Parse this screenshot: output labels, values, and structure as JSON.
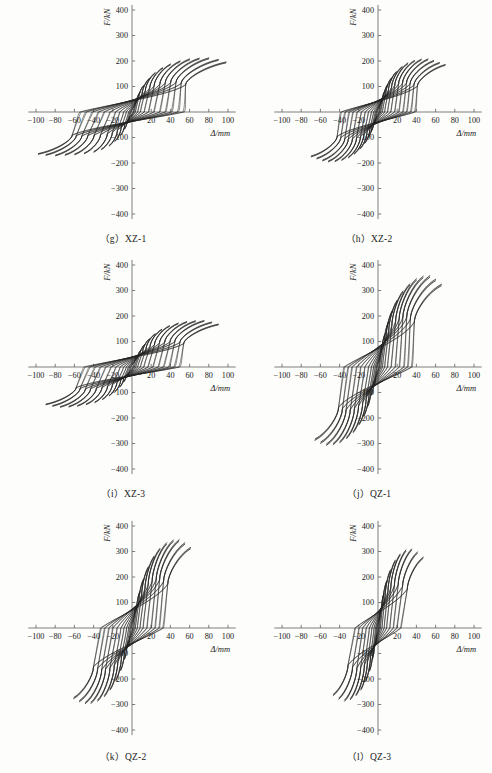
{
  "figure": {
    "kind": "hysteresis-loop-panel-grid",
    "panel_count": 6,
    "shared_axes": {
      "xlabel": "Δ/mm",
      "ylabel": "F/kN",
      "xlim": [
        -110,
        110
      ],
      "ylim": [
        -430,
        430
      ],
      "xticks": [
        -100,
        -80,
        -60,
        -40,
        -20,
        20,
        40,
        60,
        80,
        100
      ],
      "xtick_labels": [
        "−100",
        "−80",
        "−60",
        "−40",
        "−20",
        "20",
        "40",
        "60",
        "80",
        "100"
      ],
      "yticks": [
        400,
        300,
        200,
        100,
        -100,
        -200,
        -300,
        -400
      ],
      "ytick_labels": [
        "400",
        "300",
        "200",
        "100",
        "−100",
        "−200",
        "−300",
        "−400"
      ],
      "grid": false,
      "legend": "none"
    }
  },
  "panels": [
    {
      "id": "xz-1",
      "caption": "（g）XZ-1",
      "letter": "g",
      "specimen": "XZ-1",
      "peak_force_pos": 212,
      "peak_force_neg": -172,
      "peak_disp_pos": 98,
      "peak_disp_neg": -88,
      "n_cycles": 13
    },
    {
      "id": "xz-2",
      "caption": "（h）XZ-2",
      "letter": "h",
      "specimen": "XZ-2",
      "peak_force_pos": 208,
      "peak_force_neg": -196,
      "peak_disp_pos": 70,
      "peak_disp_neg": -62,
      "n_cycles": 13
    },
    {
      "id": "xz-3",
      "caption": "（i）XZ-3",
      "letter": "i",
      "specimen": "XZ-3",
      "peak_force_pos": 182,
      "peak_force_neg": -158,
      "peak_disp_pos": 88,
      "peak_disp_neg": -92,
      "n_cycles": 13
    },
    {
      "id": "qz-1",
      "caption": "（j）QZ-1",
      "letter": "j",
      "specimen": "QZ-1",
      "peak_force_pos": 358,
      "peak_force_neg": -308,
      "peak_disp_pos": 66,
      "peak_disp_neg": -74,
      "n_cycles": 12
    },
    {
      "id": "qz-2",
      "caption": "（k）QZ-2",
      "letter": "k",
      "specimen": "QZ-2",
      "peak_force_pos": 346,
      "peak_force_neg": -298,
      "peak_disp_pos": 62,
      "peak_disp_neg": -60,
      "n_cycles": 11
    },
    {
      "id": "qz-3",
      "caption": "（l）QZ-3",
      "letter": "l",
      "specimen": "QZ-3",
      "peak_force_pos": 310,
      "peak_force_neg": -288,
      "peak_disp_pos": 50,
      "peak_disp_neg": -44,
      "n_cycles": 10
    }
  ],
  "chart_data": [
    {
      "type": "line",
      "title": "（g）XZ-1",
      "xlabel": "Δ/mm",
      "ylabel": "F/kN",
      "xlim": [
        -110,
        110
      ],
      "ylim": [
        -430,
        430
      ],
      "xticks": [
        -100,
        -80,
        -60,
        -40,
        -20,
        20,
        40,
        60,
        80,
        100
      ],
      "yticks": [
        400,
        300,
        200,
        100,
        -100,
        -200,
        -300,
        -400
      ],
      "grid": false,
      "legend": "none",
      "series_kind": "cyclic-hysteresis-loops",
      "cycles": [
        {
          "disp_amp": 5,
          "force_pos": 52,
          "force_neg": -46,
          "slope_k": 11.5,
          "pinch": 0.3
        },
        {
          "disp_amp": 8,
          "force_pos": 76,
          "force_neg": -68,
          "slope_k": 10.6,
          "pinch": 0.33
        },
        {
          "disp_amp": 12,
          "force_pos": 104,
          "force_neg": -92,
          "slope_k": 9.4,
          "pinch": 0.36
        },
        {
          "disp_amp": 18,
          "force_pos": 132,
          "force_neg": -116,
          "slope_k": 8.0,
          "pinch": 0.4
        },
        {
          "disp_amp": 24,
          "force_pos": 154,
          "force_neg": -134,
          "slope_k": 6.9,
          "pinch": 0.44
        },
        {
          "disp_amp": 32,
          "force_pos": 174,
          "force_neg": -148,
          "slope_k": 5.8,
          "pinch": 0.48
        },
        {
          "disp_amp": 40,
          "force_pos": 188,
          "force_neg": -158,
          "slope_k": 5.0,
          "pinch": 0.52
        },
        {
          "disp_amp": 50,
          "force_pos": 200,
          "force_neg": -164,
          "slope_k": 4.3,
          "pinch": 0.55
        },
        {
          "disp_amp": 60,
          "force_pos": 208,
          "force_neg": -168,
          "slope_k": 3.7,
          "pinch": 0.58
        },
        {
          "disp_amp": 70,
          "force_pos": 211,
          "force_neg": -170,
          "slope_k": 3.2,
          "pinch": 0.6
        },
        {
          "disp_amp": 80,
          "force_pos": 212,
          "force_neg": -172,
          "slope_k": 2.8,
          "pinch": 0.62
        },
        {
          "disp_amp": 90,
          "force_pos": 206,
          "force_neg": -170,
          "slope_k": 2.4,
          "pinch": 0.64
        },
        {
          "disp_amp": 98,
          "force_pos": 196,
          "force_neg": -166,
          "slope_k": 2.1,
          "pinch": 0.66
        }
      ]
    },
    {
      "type": "line",
      "title": "（h）XZ-2",
      "xlabel": "Δ/mm",
      "ylabel": "F/kN",
      "xlim": [
        -110,
        110
      ],
      "ylim": [
        -430,
        430
      ],
      "xticks": [
        -100,
        -80,
        -60,
        -40,
        -20,
        20,
        40,
        60,
        80,
        100
      ],
      "yticks": [
        400,
        300,
        200,
        100,
        -100,
        -200,
        -300,
        -400
      ],
      "grid": false,
      "legend": "none",
      "series_kind": "cyclic-hysteresis-loops",
      "cycles": [
        {
          "disp_amp": 4,
          "force_pos": 54,
          "force_neg": -50,
          "slope_k": 14.5,
          "pinch": 0.3
        },
        {
          "disp_amp": 7,
          "force_pos": 82,
          "force_neg": -76,
          "slope_k": 13.2,
          "pinch": 0.33
        },
        {
          "disp_amp": 10,
          "force_pos": 108,
          "force_neg": -100,
          "slope_k": 11.8,
          "pinch": 0.36
        },
        {
          "disp_amp": 14,
          "force_pos": 134,
          "force_neg": -124,
          "slope_k": 10.2,
          "pinch": 0.4
        },
        {
          "disp_amp": 19,
          "force_pos": 158,
          "force_neg": -146,
          "slope_k": 8.8,
          "pinch": 0.44
        },
        {
          "disp_amp": 25,
          "force_pos": 178,
          "force_neg": -166,
          "slope_k": 7.4,
          "pinch": 0.48
        },
        {
          "disp_amp": 31,
          "force_pos": 192,
          "force_neg": -180,
          "slope_k": 6.4,
          "pinch": 0.52
        },
        {
          "disp_amp": 38,
          "force_pos": 202,
          "force_neg": -190,
          "slope_k": 5.5,
          "pinch": 0.55
        },
        {
          "disp_amp": 45,
          "force_pos": 207,
          "force_neg": -195,
          "slope_k": 4.8,
          "pinch": 0.58
        },
        {
          "disp_amp": 52,
          "force_pos": 208,
          "force_neg": -196,
          "slope_k": 4.2,
          "pinch": 0.6
        },
        {
          "disp_amp": 58,
          "force_pos": 202,
          "force_neg": -192,
          "slope_k": 3.7,
          "pinch": 0.62
        },
        {
          "disp_amp": 64,
          "force_pos": 194,
          "force_neg": -184,
          "slope_k": 3.3,
          "pinch": 0.64
        },
        {
          "disp_amp": 70,
          "force_pos": 186,
          "force_neg": -176,
          "slope_k": 2.9,
          "pinch": 0.66
        }
      ]
    },
    {
      "type": "line",
      "title": "（i）XZ-3",
      "xlabel": "Δ/mm",
      "ylabel": "F/kN",
      "xlim": [
        -110,
        110
      ],
      "ylim": [
        -430,
        430
      ],
      "xticks": [
        -100,
        -80,
        -60,
        -40,
        -20,
        20,
        40,
        60,
        80,
        100
      ],
      "yticks": [
        400,
        300,
        200,
        100,
        -100,
        -200,
        -300,
        -400
      ],
      "grid": false,
      "legend": "none",
      "series_kind": "cyclic-hysteresis-loops",
      "cycles": [
        {
          "disp_amp": 5,
          "force_pos": 44,
          "force_neg": -40,
          "slope_k": 9.8,
          "pinch": 0.3
        },
        {
          "disp_amp": 9,
          "force_pos": 66,
          "force_neg": -60,
          "slope_k": 9.0,
          "pinch": 0.33
        },
        {
          "disp_amp": 13,
          "force_pos": 88,
          "force_neg": -80,
          "slope_k": 8.1,
          "pinch": 0.36
        },
        {
          "disp_amp": 18,
          "force_pos": 110,
          "force_neg": -98,
          "slope_k": 7.2,
          "pinch": 0.4
        },
        {
          "disp_amp": 24,
          "force_pos": 130,
          "force_neg": -114,
          "slope_k": 6.3,
          "pinch": 0.44
        },
        {
          "disp_amp": 31,
          "force_pos": 148,
          "force_neg": -128,
          "slope_k": 5.5,
          "pinch": 0.48
        },
        {
          "disp_amp": 39,
          "force_pos": 162,
          "force_neg": -140,
          "slope_k": 4.7,
          "pinch": 0.52
        },
        {
          "disp_amp": 48,
          "force_pos": 172,
          "force_neg": -148,
          "slope_k": 4.0,
          "pinch": 0.55
        },
        {
          "disp_amp": 57,
          "force_pos": 178,
          "force_neg": -154,
          "slope_k": 3.5,
          "pinch": 0.58
        },
        {
          "disp_amp": 66,
          "force_pos": 181,
          "force_neg": -157,
          "slope_k": 3.1,
          "pinch": 0.6
        },
        {
          "disp_amp": 75,
          "force_pos": 182,
          "force_neg": -158,
          "slope_k": 2.7,
          "pinch": 0.62
        },
        {
          "disp_amp": 83,
          "force_pos": 176,
          "force_neg": -154,
          "slope_k": 2.4,
          "pinch": 0.64
        },
        {
          "disp_amp": 90,
          "force_pos": 168,
          "force_neg": -148,
          "slope_k": 2.1,
          "pinch": 0.66
        }
      ]
    },
    {
      "type": "line",
      "title": "（j）QZ-1",
      "xlabel": "Δ/mm",
      "ylabel": "F/kN",
      "xlim": [
        -110,
        110
      ],
      "ylim": [
        -430,
        430
      ],
      "xticks": [
        -100,
        -80,
        -60,
        -40,
        -20,
        20,
        40,
        60,
        80,
        100
      ],
      "yticks": [
        400,
        300,
        200,
        100,
        -100,
        -200,
        -300,
        -400
      ],
      "grid": false,
      "legend": "none",
      "series_kind": "cyclic-hysteresis-loops",
      "cycles": [
        {
          "disp_amp": 4,
          "force_pos": 82,
          "force_neg": -72,
          "slope_k": 22.0,
          "pinch": 0.28
        },
        {
          "disp_amp": 7,
          "force_pos": 128,
          "force_neg": -112,
          "slope_k": 20.0,
          "pinch": 0.31
        },
        {
          "disp_amp": 11,
          "force_pos": 178,
          "force_neg": -156,
          "slope_k": 17.6,
          "pinch": 0.34
        },
        {
          "disp_amp": 15,
          "force_pos": 222,
          "force_neg": -194,
          "slope_k": 15.4,
          "pinch": 0.38
        },
        {
          "disp_amp": 20,
          "force_pos": 262,
          "force_neg": -228,
          "slope_k": 13.4,
          "pinch": 0.42
        },
        {
          "disp_amp": 26,
          "force_pos": 298,
          "force_neg": -258,
          "slope_k": 11.6,
          "pinch": 0.46
        },
        {
          "disp_amp": 33,
          "force_pos": 326,
          "force_neg": -282,
          "slope_k": 10.0,
          "pinch": 0.5
        },
        {
          "disp_amp": 40,
          "force_pos": 346,
          "force_neg": -298,
          "slope_k": 8.7,
          "pinch": 0.54
        },
        {
          "disp_amp": 47,
          "force_pos": 356,
          "force_neg": -306,
          "slope_k": 7.6,
          "pinch": 0.57
        },
        {
          "disp_amp": 54,
          "force_pos": 358,
          "force_neg": -308,
          "slope_k": 6.7,
          "pinch": 0.6
        },
        {
          "disp_amp": 60,
          "force_pos": 344,
          "force_neg": -300,
          "slope_k": 5.9,
          "pinch": 0.62
        },
        {
          "disp_amp": 66,
          "force_pos": 324,
          "force_neg": -288,
          "slope_k": 5.2,
          "pinch": 0.64
        }
      ]
    },
    {
      "type": "line",
      "title": "（k）QZ-2",
      "xlabel": "Δ/mm",
      "ylabel": "F/kN",
      "xlim": [
        -110,
        110
      ],
      "ylim": [
        -430,
        430
      ],
      "xticks": [
        -100,
        -80,
        -60,
        -40,
        -20,
        20,
        40,
        60,
        80,
        100
      ],
      "yticks": [
        400,
        300,
        200,
        100,
        -100,
        -200,
        -300,
        -400
      ],
      "grid": false,
      "legend": "none",
      "series_kind": "cyclic-hysteresis-loops",
      "cycles": [
        {
          "disp_amp": 4,
          "force_pos": 84,
          "force_neg": -74,
          "slope_k": 23.0,
          "pinch": 0.28
        },
        {
          "disp_amp": 8,
          "force_pos": 142,
          "force_neg": -124,
          "slope_k": 20.4,
          "pinch": 0.32
        },
        {
          "disp_amp": 12,
          "force_pos": 192,
          "force_neg": -168,
          "slope_k": 18.0,
          "pinch": 0.36
        },
        {
          "disp_amp": 17,
          "force_pos": 240,
          "force_neg": -208,
          "slope_k": 15.6,
          "pinch": 0.4
        },
        {
          "disp_amp": 23,
          "force_pos": 282,
          "force_neg": -244,
          "slope_k": 13.4,
          "pinch": 0.44
        },
        {
          "disp_amp": 29,
          "force_pos": 312,
          "force_neg": -270,
          "slope_k": 11.6,
          "pinch": 0.48
        },
        {
          "disp_amp": 36,
          "force_pos": 334,
          "force_neg": -288,
          "slope_k": 10.0,
          "pinch": 0.52
        },
        {
          "disp_amp": 43,
          "force_pos": 345,
          "force_neg": -297,
          "slope_k": 8.7,
          "pinch": 0.56
        },
        {
          "disp_amp": 49,
          "force_pos": 346,
          "force_neg": -298,
          "slope_k": 7.7,
          "pinch": 0.59
        },
        {
          "disp_amp": 55,
          "force_pos": 334,
          "force_neg": -290,
          "slope_k": 6.8,
          "pinch": 0.62
        },
        {
          "disp_amp": 61,
          "force_pos": 316,
          "force_neg": -278,
          "slope_k": 6.0,
          "pinch": 0.64
        }
      ]
    },
    {
      "type": "line",
      "title": "（l）QZ-3",
      "xlabel": "Δ/mm",
      "ylabel": "F/kN",
      "xlim": [
        -110,
        110
      ],
      "ylim": [
        -430,
        430
      ],
      "xticks": [
        -100,
        -80,
        -60,
        -40,
        -20,
        20,
        40,
        60,
        80,
        100
      ],
      "yticks": [
        400,
        300,
        200,
        100,
        -100,
        -200,
        -300,
        -400
      ],
      "grid": false,
      "legend": "none",
      "series_kind": "cyclic-hysteresis-loops",
      "cycles": [
        {
          "disp_amp": 3,
          "force_pos": 78,
          "force_neg": -72,
          "slope_k": 27.0,
          "pinch": 0.27
        },
        {
          "disp_amp": 6,
          "force_pos": 134,
          "force_neg": -124,
          "slope_k": 24.0,
          "pinch": 0.31
        },
        {
          "disp_amp": 9,
          "force_pos": 184,
          "force_neg": -170,
          "slope_k": 21.2,
          "pinch": 0.35
        },
        {
          "disp_amp": 13,
          "force_pos": 228,
          "force_neg": -210,
          "slope_k": 18.4,
          "pinch": 0.39
        },
        {
          "disp_amp": 18,
          "force_pos": 266,
          "force_neg": -244,
          "slope_k": 15.8,
          "pinch": 0.43
        },
        {
          "disp_amp": 23,
          "force_pos": 290,
          "force_neg": -266,
          "slope_k": 13.6,
          "pinch": 0.47
        },
        {
          "disp_amp": 29,
          "force_pos": 306,
          "force_neg": -282,
          "slope_k": 11.6,
          "pinch": 0.51
        },
        {
          "disp_amp": 35,
          "force_pos": 310,
          "force_neg": -288,
          "slope_k": 10.0,
          "pinch": 0.55
        },
        {
          "disp_amp": 41,
          "force_pos": 298,
          "force_neg": -280,
          "slope_k": 8.7,
          "pinch": 0.58
        },
        {
          "disp_amp": 47,
          "force_pos": 278,
          "force_neg": -266,
          "slope_k": 7.6,
          "pinch": 0.61
        }
      ]
    }
  ]
}
